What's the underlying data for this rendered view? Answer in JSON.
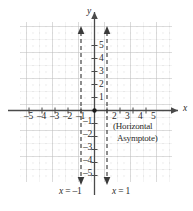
{
  "figure": {
    "type": "coordinate-graph"
  },
  "axes": {
    "x_label": "x",
    "y_label": "y",
    "x_ticks_negative": [
      "–5",
      "–4",
      "–3",
      "–2",
      "–1"
    ],
    "x_ticks_positive": [
      "2",
      "3",
      "4",
      "5"
    ],
    "y_ticks_positive": [
      "5",
      "4",
      "3",
      "2",
      "1"
    ],
    "y_ticks_negative": [
      "–1",
      "–2",
      "–3",
      "–4",
      "–5"
    ],
    "origin_label": ""
  },
  "annotations": {
    "horizontal_asymptote_line1": "(Horizontal",
    "horizontal_asymptote_line2": "Asymptote)",
    "vertical_asymptote_left": "x = –1",
    "vertical_asymptote_right": "x = 1"
  },
  "colors": {
    "axis": "#4a4a4a",
    "grid_major": "#cfcfcf",
    "grid_minor": "#d9d9d9",
    "dashed": "#3a3a3a",
    "text": "#2b2b2b",
    "background": "#ffffff"
  },
  "chart_data": {
    "type": "line",
    "title": "",
    "xlabel": "x",
    "ylabel": "y",
    "xlim": [
      -6,
      6
    ],
    "ylim": [
      -6,
      6
    ],
    "grid": true,
    "legend": "none",
    "x_tick_values": [
      -5,
      -4,
      -3,
      -2,
      -1,
      2,
      3,
      4,
      5
    ],
    "y_tick_values": [
      5,
      4,
      3,
      2,
      1,
      -1,
      -2,
      -3,
      -4,
      -5
    ],
    "series": [
      {
        "name": "vertical asymptote x = -1",
        "style": "dashed",
        "x": [
          -1,
          -1
        ],
        "y": [
          -5.8,
          5.8
        ]
      },
      {
        "name": "vertical asymptote x = 1",
        "style": "dashed",
        "x": [
          1,
          1
        ],
        "y": [
          -5.8,
          5.8
        ]
      },
      {
        "name": "horizontal asymptote y = 0",
        "style": "axis-coincident",
        "x": [
          -6,
          6
        ],
        "y": [
          0,
          0
        ]
      }
    ],
    "annotations": [
      {
        "text": "(Horizontal",
        "x": 2.0,
        "y": -1.1
      },
      {
        "text": "Asymptote)",
        "x": 2.2,
        "y": -2.0
      },
      {
        "text": "x = –1",
        "x": -1.6,
        "y": -6.6
      },
      {
        "text": "x = 1",
        "x": 0.6,
        "y": -6.6
      }
    ]
  }
}
